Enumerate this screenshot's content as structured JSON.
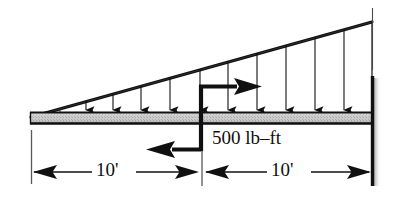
{
  "figure": {
    "type": "engineering-statics-diagram",
    "background_color": "#ffffff",
    "ink_color": "#101010",
    "beam_fill_color": "#c9c9c9",
    "shadow_color": "#b4b4b4"
  },
  "labels": {
    "moment": "500 lb–ft",
    "dimension_left": "10'",
    "dimension_right": "10'"
  },
  "beam": {
    "left_x": 30,
    "right_x": 372,
    "top_y": 112,
    "bottom_y": 124
  },
  "load": {
    "shape": "triangular",
    "zero_at": "left-tip",
    "max_at": "right-support",
    "apex_y": 22,
    "arrow_count": 10,
    "arrow_x_positions": [
      60,
      86,
      113,
      141,
      170,
      228,
      257,
      286,
      315,
      344
    ]
  },
  "support": {
    "kind": "fixed-wall",
    "x": 372,
    "top_y": 76,
    "bottom_y": 186
  },
  "couple": {
    "stem_x": 201,
    "top_arrow_y": 85,
    "top_arrow_direction": "right",
    "bottom_arrow_y": 151,
    "bottom_arrow_direction": "left",
    "sense": "counterclockwise"
  },
  "dimensions": {
    "line_y": 172,
    "left_extension_x": 31,
    "middle_tick_x": 202,
    "right_extension_x": 371,
    "segments": [
      {
        "label": "10'",
        "from_x": 31,
        "to_x": 202
      },
      {
        "label": "10'",
        "from_x": 202,
        "to_x": 371
      }
    ]
  }
}
